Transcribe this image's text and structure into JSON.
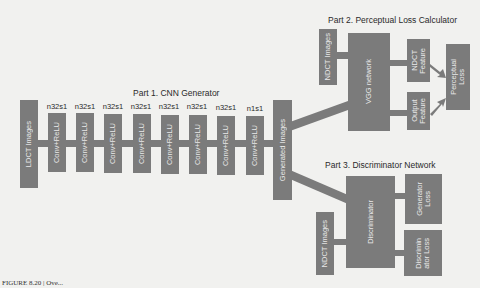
{
  "part1": {
    "title": "Part 1. CNN Generator",
    "input_label": "LDCT Images",
    "layers": [
      {
        "param": "n32s1",
        "label": "Conv+ReLU"
      },
      {
        "param": "n32s1",
        "label": "Conv+ReLU"
      },
      {
        "param": "n32s1",
        "label": "Conv+ReLU"
      },
      {
        "param": "n32s1",
        "label": "Conv+ReLU"
      },
      {
        "param": "n32s1",
        "label": "Conv+ReLU"
      },
      {
        "param": "n32s1",
        "label": "Conv+ReLU"
      },
      {
        "param": "n32s1",
        "label": "Conv+ReLU"
      },
      {
        "param": "n1s1",
        "label": "Conv+ReLU"
      }
    ],
    "output_label": "Generated Images"
  },
  "part2": {
    "title": "Part 2. Perceptual Loss Calculator",
    "input_label": "NDCT Images",
    "network_label": "VGG network",
    "ndct_feature_label": "NDCT\nFeature",
    "output_feature_label": "Output\nFeature",
    "loss_label": "Perceptual\nLoss"
  },
  "part3": {
    "title": "Part 3. Discriminator Network",
    "input_label": "NDCT Images",
    "network_label": "Discriminator",
    "generator_loss_label": "Generator\nLoss",
    "discriminator_loss_label": "Discrimin\nator Loss"
  },
  "caption": "FIGURE 8.20 | Ove..."
}
